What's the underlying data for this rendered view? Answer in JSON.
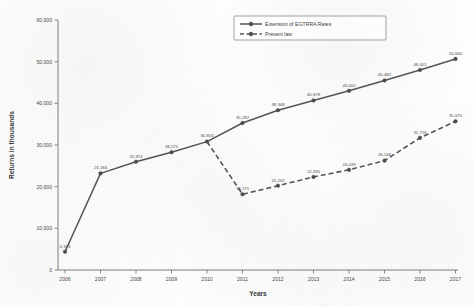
{
  "chart_data": {
    "type": "line",
    "title": "",
    "xlabel": "Years",
    "ylabel": "Returns in thousands",
    "x": [
      2006,
      2007,
      2008,
      2009,
      2010,
      2011,
      2012,
      2013,
      2014,
      2015,
      2016,
      2017
    ],
    "xticklabels": [
      "2006",
      "2007",
      "2008",
      "2009",
      "2010",
      "2011",
      "2012",
      "2013",
      "2014",
      "2015",
      "2016",
      "2017"
    ],
    "yticklabels": [
      "0",
      "10,000",
      "20,000",
      "30,000",
      "40,000",
      "50,000",
      "60,000"
    ],
    "yticks": [
      0,
      10000,
      20000,
      30000,
      40000,
      50000,
      60000
    ],
    "ylim": [
      0,
      60000
    ],
    "xlim": [
      2006,
      2017
    ],
    "grid": false,
    "legend_position": "top-right",
    "series": [
      {
        "name": "Extension of EGTRRA Rates",
        "style": "solid",
        "x": [
          2006,
          2007,
          2008,
          2009,
          2010,
          2011,
          2012,
          2013,
          2014,
          2015,
          2016,
          2017
        ],
        "values": [
          4373,
          23184,
          25974,
          28275,
          30816,
          35282,
          38348,
          40678,
          43000,
          45482,
          48001,
          50660
        ],
        "labels": [
          "4,373",
          "23,184",
          "25,974",
          "28,275",
          "30,816",
          "35,282",
          "38,348",
          "40,678",
          "43,000",
          "45,482",
          "48,001",
          "50,660"
        ]
      },
      {
        "name": "Present law",
        "style": "dashed",
        "x": [
          2010,
          2011,
          2012,
          2013,
          2014,
          2015,
          2016,
          2017
        ],
        "values": [
          30816,
          18171,
          20232,
          22335,
          24039,
          26246,
          31716,
          35675
        ],
        "labels": [
          "",
          "18,171",
          "20,232",
          "22,335",
          "24,039",
          "26,246",
          "31,716",
          "35,675"
        ]
      }
    ],
    "legend": [
      {
        "label": "Extension of EGTRRA Rates",
        "style": "solid"
      },
      {
        "label": "Present law",
        "style": "dashed"
      }
    ],
    "colors": {
      "line": "#555555",
      "axis": "#6f6f6f",
      "text": "#3a3a3a",
      "background": "#fdfdfd"
    }
  }
}
